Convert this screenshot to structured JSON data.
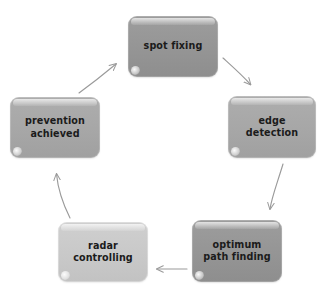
{
  "diagram": {
    "type": "cycle-flowchart",
    "background_color": "#ffffff",
    "arrow_color": "#9a9a9a",
    "text_color": "#1b1b1b",
    "nodes": [
      {
        "id": "spot-fixing",
        "label": "spot fixing",
        "line1": "spot fixing",
        "line2": "",
        "tone": "dark",
        "fill": "#949494",
        "order": 1
      },
      {
        "id": "edge-detection",
        "label": "edge detection",
        "line1": "edge",
        "line2": "detection",
        "tone": "mid",
        "fill": "#a6a6a6",
        "order": 2
      },
      {
        "id": "optimum-path",
        "label": "optimum path finding",
        "line1": "optimum",
        "line2": "path finding",
        "tone": "dark",
        "fill": "#949494",
        "order": 3
      },
      {
        "id": "radar-controlling",
        "label": "radar controlling",
        "line1": "radar",
        "line2": "controlling",
        "tone": "light",
        "fill": "#c8c8c8",
        "order": 4
      },
      {
        "id": "prevention",
        "label": "prevention achieved",
        "line1": "prevention",
        "line2": "achieved",
        "tone": "mid",
        "fill": "#a6a6a6",
        "order": 5
      }
    ],
    "edges": [
      {
        "id": "e1",
        "from": "spot-fixing",
        "to": "edge-detection",
        "shape": "curve-down-right"
      },
      {
        "id": "e2",
        "from": "edge-detection",
        "to": "optimum-path",
        "shape": "curve-down"
      },
      {
        "id": "e3",
        "from": "optimum-path",
        "to": "radar-controlling",
        "shape": "straight-left"
      },
      {
        "id": "e4",
        "from": "radar-controlling",
        "to": "prevention",
        "shape": "curve-up"
      },
      {
        "id": "e5",
        "from": "prevention",
        "to": "spot-fixing",
        "shape": "diagonal-up-right"
      }
    ]
  }
}
